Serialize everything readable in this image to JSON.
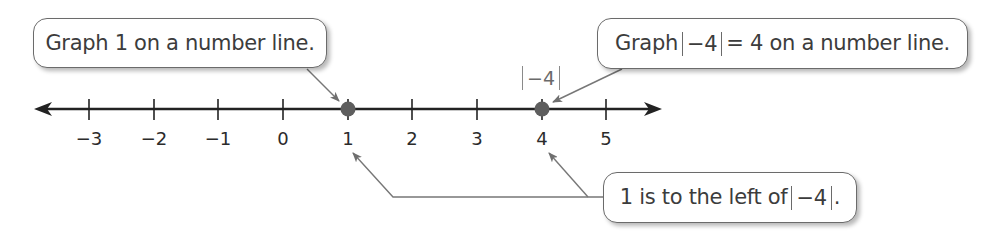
{
  "diagram": {
    "type": "number-line",
    "number_line": {
      "min_tick": -3,
      "max_tick": 5,
      "ticks": [
        -3,
        -2,
        -1,
        0,
        1,
        2,
        3,
        4,
        5
      ],
      "tick_labels": [
        "−3",
        "−2",
        "−1",
        "0",
        "1",
        "2",
        "3",
        "4",
        "5"
      ],
      "arrows": "both-ends",
      "line_color": "#222222"
    },
    "points": [
      {
        "value": 1,
        "label": "1",
        "color": "#5e5e5e"
      },
      {
        "value": 4,
        "label": "|−4|",
        "color": "#5e5e5e"
      }
    ],
    "point_annotation": {
      "abs_inner": "−4"
    },
    "callouts": {
      "graph_one": {
        "text": "Graph 1 on a number line."
      },
      "graph_abs": {
        "prefix": "Graph",
        "abs_inner": "−4",
        "suffix": "= 4 on a number line."
      },
      "comparison": {
        "prefix": "1 is to the left of",
        "abs_inner": "−4",
        "suffix": "."
      }
    },
    "colors": {
      "callout_border": "#6b6b6b",
      "leader_line": "#777777",
      "text": "#3c3c3c"
    }
  }
}
